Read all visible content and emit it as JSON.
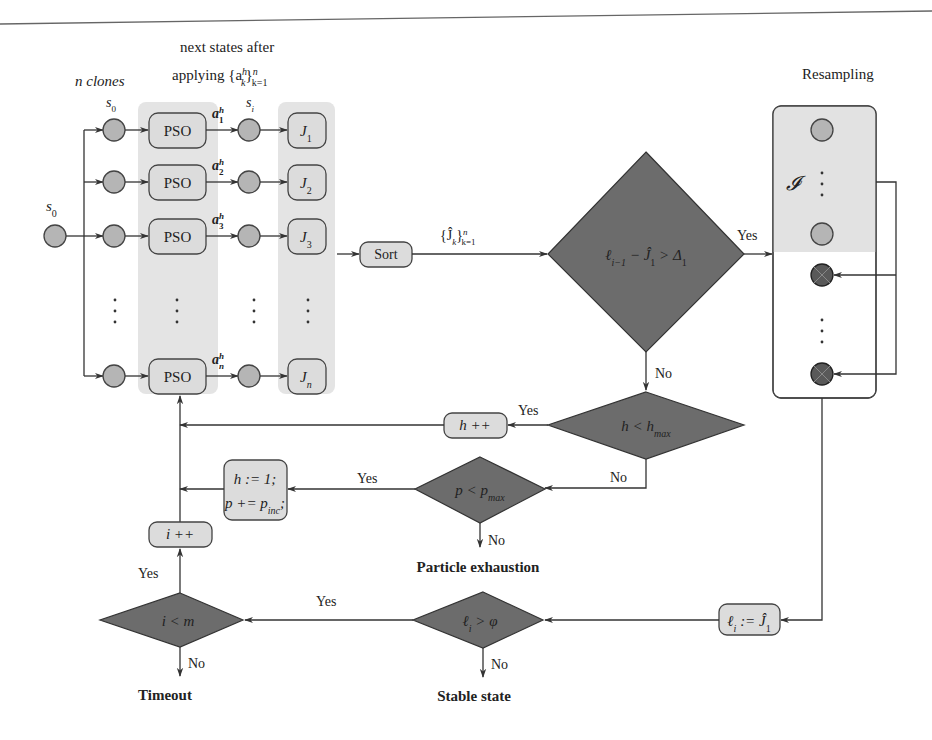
{
  "figure": {
    "top_rule": true,
    "colors": {
      "node_fill": "#b5b5b5",
      "box_fill": "#dcdcdc",
      "column_shade": "#e4e4e4",
      "diamond_fill": "#6c6c6c",
      "discarded_particle_fill": "#595959",
      "line": "#333333"
    }
  },
  "headers": {
    "n_clones": "n clones",
    "next_states_line1": "next states after",
    "next_states_line2": "applying {a",
    "next_states_sup": "h",
    "next_states_sub": "k",
    "next_states_close": "}",
    "next_states_range_sup": "n",
    "next_states_range_sub": "k=1",
    "resampling": "Resampling"
  },
  "initial_state": {
    "label": "s",
    "sub": "0"
  },
  "clone_state_label": {
    "label": "s",
    "sub": "0"
  },
  "next_state_label": {
    "label": "s",
    "sub": "i"
  },
  "rows": [
    {
      "pso": "PSO",
      "action": "a",
      "action_sub": "1",
      "action_sup": "h",
      "cost": "J",
      "cost_sub": "1"
    },
    {
      "pso": "PSO",
      "action": "a",
      "action_sub": "2",
      "action_sup": "h",
      "cost": "J",
      "cost_sub": "2"
    },
    {
      "pso": "PSO",
      "action": "a",
      "action_sub": "3",
      "action_sup": "h",
      "cost": "J",
      "cost_sub": "3"
    },
    {
      "pso": "PSO",
      "action": "a",
      "action_sub": "n",
      "action_sup": "h",
      "cost": "J",
      "cost_sub": "n"
    }
  ],
  "ellipsis": "⋮",
  "sort": {
    "label": "Sort",
    "output": "{Ĵ",
    "output_sub": "k",
    "output_close": "}",
    "output_sup": "n",
    "output_range": "k=1"
  },
  "decisions": {
    "improvement": {
      "text": "ℓ",
      "text_sub": "i−1",
      "rest": " − Ĵ",
      "rest_sub": "1",
      "tail": " > Δ",
      "tail_sub": "1",
      "yes": "Yes",
      "no": "No"
    },
    "h_check": {
      "text": "h < h",
      "sub": "max",
      "yes": "Yes",
      "no": "No"
    },
    "p_check": {
      "text": "p < p",
      "sub": "max",
      "yes": "Yes",
      "no": "No"
    },
    "stable_check": {
      "text": "ℓ",
      "sub": "i",
      "rest": " > φ",
      "yes": "Yes",
      "no": "No"
    },
    "iter_check": {
      "text": "i < m",
      "yes": "Yes",
      "no": "No"
    }
  },
  "actions": {
    "h_inc": "h ++",
    "reset_line1": "h := 1;",
    "reset_line2": "p += p",
    "reset_line2_sub": "inc",
    "reset_line2_tail": ";",
    "i_inc": "i ++",
    "assign": "ℓ",
    "assign_sub": "i",
    "assign_rest": " := Ĵ",
    "assign_rest_sub": "1"
  },
  "resampling": {
    "set_label": "𝓘"
  },
  "terminals": {
    "particle_exhaustion": "Particle exhaustion",
    "timeout": "Timeout",
    "stable_state": "Stable state"
  }
}
